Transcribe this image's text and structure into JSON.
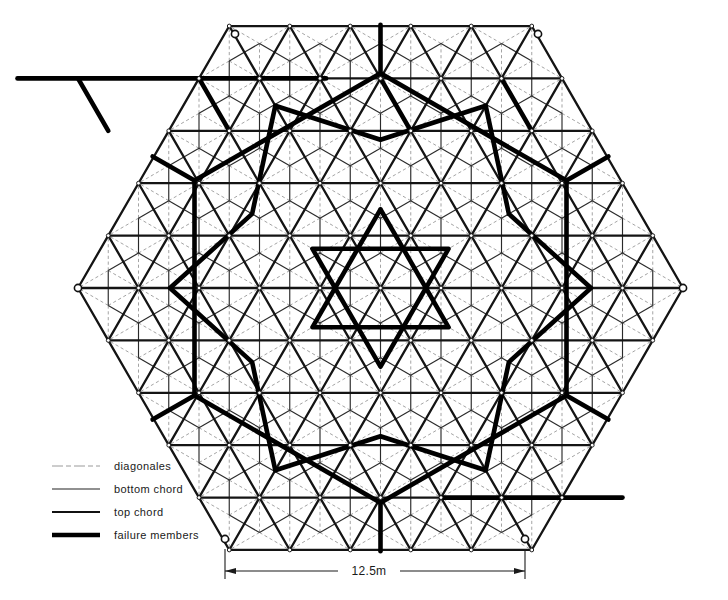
{
  "figure": {
    "background_color": "#ffffff",
    "ink_color": "#1a1a1a"
  },
  "legend": {
    "name": "legend",
    "items": [
      {
        "key": "diagonales",
        "label": "diagonales",
        "style": "dashed-thin",
        "stroke_width": 0.8,
        "color": "#808080"
      },
      {
        "key": "bottom_chord",
        "label": "bottom chord",
        "style": "solid-thin",
        "stroke_width": 1.1,
        "color": "#222222"
      },
      {
        "key": "top_chord",
        "label": "top chord",
        "style": "solid-medium",
        "stroke_width": 2.2,
        "color": "#111111"
      },
      {
        "key": "failure_members",
        "label": "failure members",
        "style": "solid-thick",
        "stroke_width": 4.4,
        "color": "#000000"
      }
    ]
  },
  "dimension": {
    "name": "span-dimension",
    "label": "12.5m",
    "value": 12.5,
    "unit": "m",
    "axis": "horizontal",
    "measures": "bottom edge span of hexagon"
  },
  "chart_data": {
    "type": "diagram",
    "subtype": "hexagonal-double-layer-space-truss",
    "title": "",
    "grid": {
      "divisions_per_edge": 5,
      "edge_length_m": 12.5,
      "module_length_m": 2.5,
      "geometry": "equilateral triangular grid, offset top and bottom layers"
    },
    "hexagon_vertices_px": [
      [
        235,
        34
      ],
      [
        538,
        34
      ],
      [
        683,
        288
      ],
      [
        525,
        539
      ],
      [
        225,
        539
      ],
      [
        78,
        288
      ]
    ],
    "layers": [
      {
        "name": "top chord",
        "description": "upper triangular grid, medium weight lines"
      },
      {
        "name": "bottom chord",
        "description": "offset lower triangular grid, thin lines"
      },
      {
        "name": "diagonales",
        "description": "web members connecting layers, thin dashed grey"
      }
    ],
    "failure_pattern": {
      "description": "Thick members trace concentric triangular and hexagonal rings radiating from the centre of the grid",
      "member_count_highlighted": 96,
      "symmetry": "approximately 3-fold / 6-fold about the hexagon centre"
    }
  }
}
